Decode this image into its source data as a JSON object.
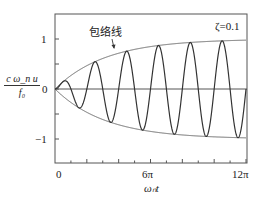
{
  "chart_data": {
    "type": "line",
    "title": "",
    "annotation_envelope": "包络线",
    "annotation_param": "ζ=0.1",
    "xlabel": "ω_n t",
    "ylabel": "c ω_n u / f_0",
    "ylabel_numerator": "c ω_n u",
    "ylabel_denominator": "f₀",
    "xlabel_display": "ωₙt",
    "x_ticks": [
      "0",
      "6π",
      "12π"
    ],
    "y_ticks": [
      "1",
      "0",
      "−1"
    ],
    "xlim": [
      0,
      37.7
    ],
    "ylim": [
      -1.5,
      1.5
    ],
    "zeta": 0.1,
    "grid": false,
    "series": [
      {
        "name": "response",
        "formula": "(1 - exp(-ζ x)) sin(x)",
        "color": "#333333"
      },
      {
        "name": "envelope_upper",
        "formula": "1 - exp(-ζ x)",
        "color": "#555555"
      },
      {
        "name": "envelope_lower",
        "formula": "-(1 - exp(-ζ x))",
        "color": "#555555"
      }
    ],
    "sample_points": {
      "x": [
        0,
        1.57,
        4.71,
        7.85,
        11.0,
        14.14,
        17.28,
        18.85,
        20.42,
        23.56,
        26.7,
        29.85,
        32.99,
        36.13,
        37.7
      ],
      "response": [
        0,
        0.15,
        -0.38,
        0.54,
        -0.67,
        0.76,
        -0.82,
        0,
        0.87,
        -0.9,
        0.93,
        -0.95,
        0.96,
        -0.97,
        0
      ]
    }
  }
}
